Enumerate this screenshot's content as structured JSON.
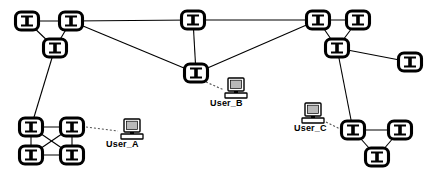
{
  "canvas": {
    "width": 439,
    "height": 177,
    "background": "#ffffff"
  },
  "style": {
    "link_color": "#000000",
    "user_link_color": "#555555",
    "node_stroke": "#000000",
    "node_fill": "#ffffff",
    "label_color": "#000000"
  },
  "diagram": {
    "type": "network-topology",
    "node_icon_name": "network-switch-icon",
    "host_icon_name": "computer-monitor-icon"
  },
  "nodes": [
    {
      "id": "n1",
      "name": "switch-node-1",
      "x": 27,
      "y": 21
    },
    {
      "id": "n2",
      "name": "switch-node-2",
      "x": 71,
      "y": 21
    },
    {
      "id": "n3",
      "name": "switch-node-3",
      "x": 55,
      "y": 48
    },
    {
      "id": "n4",
      "name": "switch-node-4",
      "x": 193,
      "y": 20
    },
    {
      "id": "n5",
      "name": "switch-node-5",
      "x": 196,
      "y": 73
    },
    {
      "id": "n6",
      "name": "switch-node-6",
      "x": 318,
      "y": 20
    },
    {
      "id": "n7",
      "name": "switch-node-7",
      "x": 358,
      "y": 20
    },
    {
      "id": "n8",
      "name": "switch-node-8",
      "x": 337,
      "y": 48
    },
    {
      "id": "n9",
      "name": "switch-node-9",
      "x": 410,
      "y": 62
    },
    {
      "id": "n10",
      "name": "switch-node-10",
      "x": 31,
      "y": 127
    },
    {
      "id": "n11",
      "name": "switch-node-11",
      "x": 72,
      "y": 127
    },
    {
      "id": "n12",
      "name": "switch-node-12",
      "x": 31,
      "y": 155
    },
    {
      "id": "n13",
      "name": "switch-node-13",
      "x": 72,
      "y": 155
    },
    {
      "id": "n14",
      "name": "switch-node-14",
      "x": 353,
      "y": 130
    },
    {
      "id": "n15",
      "name": "switch-node-15",
      "x": 400,
      "y": 130
    },
    {
      "id": "n16",
      "name": "switch-node-16",
      "x": 377,
      "y": 157
    }
  ],
  "links": [
    {
      "from": "n1",
      "to": "n2"
    },
    {
      "from": "n1",
      "to": "n3"
    },
    {
      "from": "n2",
      "to": "n3"
    },
    {
      "from": "n2",
      "to": "n4"
    },
    {
      "from": "n2",
      "to": "n5"
    },
    {
      "from": "n4",
      "to": "n6"
    },
    {
      "from": "n4",
      "to": "n5"
    },
    {
      "from": "n5",
      "to": "n6"
    },
    {
      "from": "n3",
      "to": "n10"
    },
    {
      "from": "n6",
      "to": "n7"
    },
    {
      "from": "n6",
      "to": "n8"
    },
    {
      "from": "n7",
      "to": "n8"
    },
    {
      "from": "n8",
      "to": "n9"
    },
    {
      "from": "n8",
      "to": "n14"
    },
    {
      "from": "n10",
      "to": "n11"
    },
    {
      "from": "n10",
      "to": "n12"
    },
    {
      "from": "n10",
      "to": "n13"
    },
    {
      "from": "n11",
      "to": "n12"
    },
    {
      "from": "n11",
      "to": "n13"
    },
    {
      "from": "n12",
      "to": "n13"
    },
    {
      "from": "n14",
      "to": "n15"
    },
    {
      "from": "n14",
      "to": "n16"
    },
    {
      "from": "n15",
      "to": "n16"
    }
  ],
  "hosts": [
    {
      "id": "hostA",
      "name": "host-user-a",
      "label": "User_A",
      "icon_x": 124,
      "icon_y": 119,
      "label_x": 106,
      "label_y": 139,
      "link_from_node": "n11",
      "link_x1": 86,
      "link_y1": 127,
      "link_x2": 118,
      "link_y2": 131
    },
    {
      "id": "hostB",
      "name": "host-user-b",
      "label": "User_B",
      "icon_x": 228,
      "icon_y": 78,
      "label_x": 210,
      "label_y": 98,
      "link_from_node": "n5",
      "link_x1": 206,
      "link_y1": 82,
      "link_x2": 224,
      "link_y2": 90
    },
    {
      "id": "hostC",
      "name": "host-user-c",
      "label": "User_C",
      "icon_x": 305,
      "icon_y": 103,
      "label_x": 294,
      "label_y": 123,
      "link_from_node": "n14",
      "link_x1": 326,
      "link_y1": 122,
      "link_x2": 340,
      "link_y2": 129
    }
  ]
}
